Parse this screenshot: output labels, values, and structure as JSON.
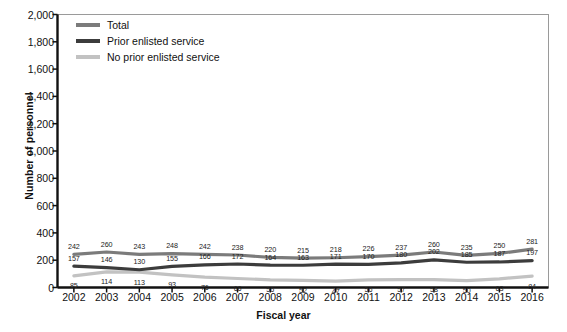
{
  "chart_data": {
    "type": "line",
    "title": "",
    "xlabel": "Fiscal year",
    "ylabel": "Number of personnel",
    "categories": [
      "2002",
      "2003",
      "2004",
      "2005",
      "2006",
      "2007",
      "2008",
      "2009",
      "2010",
      "2011",
      "2012",
      "2013",
      "2014",
      "2015",
      "2016"
    ],
    "x": [
      2002,
      2003,
      2004,
      2005,
      2006,
      2007,
      2008,
      2009,
      2010,
      2011,
      2012,
      2013,
      2014,
      2015,
      2016
    ],
    "ylim": [
      0,
      2000
    ],
    "yticks": [
      "0",
      "200",
      "400",
      "600",
      "800",
      "1,000",
      "1,200",
      "1,400",
      "1,600",
      "1,800",
      "2,000"
    ],
    "ytick_values": [
      0,
      200,
      400,
      600,
      800,
      1000,
      1200,
      1400,
      1600,
      1800,
      2000
    ],
    "grid": false,
    "legend_position": "top-left",
    "series": [
      {
        "name": "Total",
        "color": "#7b7b7b",
        "values": [
          242,
          260,
          243,
          248,
          242,
          238,
          220,
          215,
          218,
          226,
          237,
          260,
          235,
          250,
          281
        ]
      },
      {
        "name": "Prior enlisted service",
        "color": "#3c3c3c",
        "values": [
          157,
          146,
          130,
          155,
          166,
          172,
          164,
          163,
          171,
          170,
          180,
          202,
          185,
          187,
          197
        ]
      },
      {
        "name": "No prior enlisted service",
        "color": "#c2c2c2",
        "values": [
          85,
          114,
          113,
          93,
          76,
          66,
          56,
          52,
          47,
          56,
          57,
          58,
          50,
          63,
          84
        ]
      }
    ]
  },
  "axis_color": "#111111",
  "plot_border_color": "#9a9a9a"
}
